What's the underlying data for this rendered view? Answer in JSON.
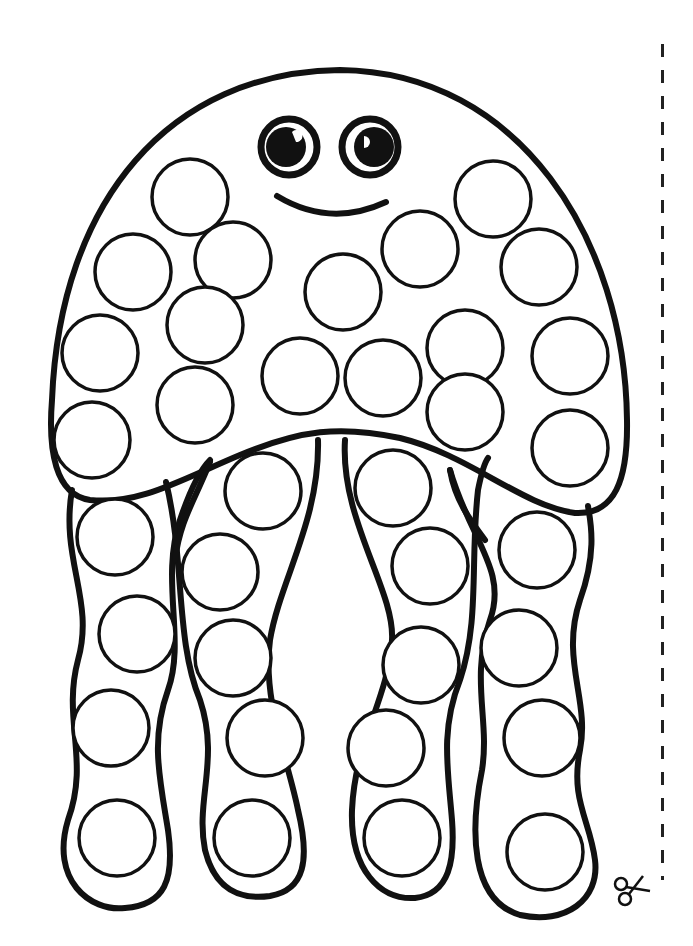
{
  "page": {
    "colors": {
      "ink": "#111111",
      "paper": "#ffffff"
    }
  },
  "jellyfish": {
    "face": {
      "eyes": [
        {
          "cx": 289,
          "cy": 147,
          "r": 30
        },
        {
          "cx": 370,
          "cy": 147,
          "r": 30
        }
      ],
      "smile": "M 277 196 Q 330 228 386 202"
    },
    "head_dots": [
      {
        "cx": 190,
        "cy": 197
      },
      {
        "cx": 133,
        "cy": 272
      },
      {
        "cx": 233,
        "cy": 260
      },
      {
        "cx": 343,
        "cy": 292
      },
      {
        "cx": 420,
        "cy": 249
      },
      {
        "cx": 493,
        "cy": 199
      },
      {
        "cx": 539,
        "cy": 267
      },
      {
        "cx": 205,
        "cy": 325
      },
      {
        "cx": 100,
        "cy": 353
      },
      {
        "cx": 300,
        "cy": 376
      },
      {
        "cx": 383,
        "cy": 378
      },
      {
        "cx": 465,
        "cy": 348
      },
      {
        "cx": 570,
        "cy": 356
      },
      {
        "cx": 195,
        "cy": 405
      },
      {
        "cx": 92,
        "cy": 440
      },
      {
        "cx": 465,
        "cy": 412
      },
      {
        "cx": 570,
        "cy": 448
      }
    ],
    "tentacle_dots": [
      {
        "cx": 115,
        "cy": 537
      },
      {
        "cx": 137,
        "cy": 634
      },
      {
        "cx": 111,
        "cy": 728
      },
      {
        "cx": 117,
        "cy": 838
      },
      {
        "cx": 263,
        "cy": 491
      },
      {
        "cx": 220,
        "cy": 572
      },
      {
        "cx": 233,
        "cy": 658
      },
      {
        "cx": 265,
        "cy": 738
      },
      {
        "cx": 252,
        "cy": 838
      },
      {
        "cx": 393,
        "cy": 488
      },
      {
        "cx": 430,
        "cy": 566
      },
      {
        "cx": 421,
        "cy": 665
      },
      {
        "cx": 386,
        "cy": 748
      },
      {
        "cx": 402,
        "cy": 838
      },
      {
        "cx": 537,
        "cy": 550
      },
      {
        "cx": 519,
        "cy": 648
      },
      {
        "cx": 542,
        "cy": 738
      },
      {
        "cx": 545,
        "cy": 852
      }
    ],
    "dot_radius": 38,
    "dot_count": 35
  },
  "cut_guide": {
    "style": "dashed",
    "icon": "scissors-icon"
  }
}
